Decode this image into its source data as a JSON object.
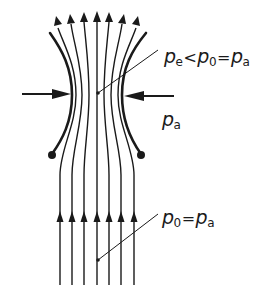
{
  "diagram": {
    "colors": {
      "stroke": "#1a1a1a",
      "background": "#ffffff"
    },
    "labels": {
      "throat": {
        "p1": "p",
        "s1": "e",
        "op1": "<",
        "p2": "p",
        "s2": "0",
        "op2": "=",
        "p3": "p",
        "s3": "a"
      },
      "ambient": {
        "p": "p",
        "s": "a"
      },
      "inlet": {
        "p1": "p",
        "s1": "0",
        "op1": "=",
        "p2": "p",
        "s2": "a"
      }
    },
    "streamline_count": 7,
    "elements": [
      "streamlines",
      "jet-boundaries",
      "edge-dots",
      "inward-pressure-arrows",
      "leader-lines"
    ]
  }
}
